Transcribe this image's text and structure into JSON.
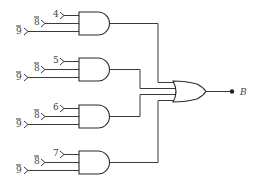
{
  "diagram": {
    "type": "logic-circuit",
    "and_gates": [
      {
        "id": "and1",
        "inputs": [
          "4",
          "8",
          "9"
        ],
        "inverted": [
          false,
          true,
          true
        ]
      },
      {
        "id": "and2",
        "inputs": [
          "5",
          "8",
          "9"
        ],
        "inverted": [
          false,
          true,
          true
        ]
      },
      {
        "id": "and3",
        "inputs": [
          "6",
          "8",
          "9"
        ],
        "inverted": [
          false,
          true,
          true
        ]
      },
      {
        "id": "and4",
        "inputs": [
          "7",
          "8",
          "9"
        ],
        "inverted": [
          false,
          true,
          true
        ]
      }
    ],
    "or_gate": {
      "id": "or1",
      "inputs": 4
    },
    "output": {
      "label": "B"
    }
  }
}
